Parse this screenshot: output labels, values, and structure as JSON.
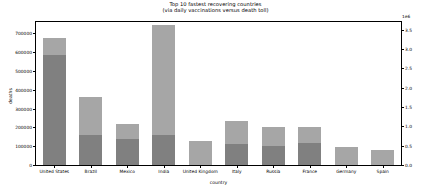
{
  "chart_data": {
    "type": "bar",
    "title": "Top 10 fastest recovering countries",
    "subtitle": "(via daily vaccinations versus death toll)",
    "title_lines": [
      "Top 10 fastest recovering countries",
      "(via daily vaccinations versus death toll)"
    ],
    "xlabel": "country",
    "ylabel": "deaths",
    "ylabel_right": "Total number of daily vaccinations (in millions)",
    "right_axis_exponent": "1e6",
    "grid": false,
    "legend": "none",
    "categories": [
      "United States",
      "Brazil",
      "Mexico",
      "India",
      "United Kingdom",
      "Italy",
      "Russia",
      "France",
      "Germany",
      "Spain"
    ],
    "ylim": [
      0,
      760000
    ],
    "yticks": [
      0,
      100000,
      200000,
      300000,
      400000,
      500000,
      600000,
      700000
    ],
    "ytick_labels": [
      "0",
      "100000",
      "200000",
      "300000",
      "400000",
      "500000",
      "600000",
      "700000"
    ],
    "ylim_right": [
      0.0,
      3.7
    ],
    "yticks_right": [
      0.0,
      0.5,
      1.0,
      1.5,
      2.0,
      2.5,
      3.0,
      3.5
    ],
    "ytick_labels_right": [
      "0.0",
      "0.5",
      "1.0",
      "1.5",
      "2.0",
      "2.5",
      "3.0",
      "3.5"
    ],
    "series": [
      {
        "name": "deaths",
        "axis": "left",
        "color": "#808080",
        "values": [
          572000,
          152000,
          136000,
          245000,
          0,
          108000,
          101000,
          118000,
          0,
          0
        ]
      },
      {
        "name": "daily vaccinations",
        "axis": "right",
        "color": "#a6a6a6",
        "values": [
          0.3,
          0.89,
          0.35,
          2.58,
          0.62,
          0.61,
          0.49,
          0.42,
          0.47,
          0.41
        ]
      }
    ],
    "bar_totals_left_units": [
      632000,
      352000,
      208000,
      732000,
      125000,
      230000,
      200000,
      200000,
      190000,
      165000
    ]
  },
  "bars": [
    {
      "label": "United States",
      "death_px": 110,
      "vacc_px": 17
    },
    {
      "label": "Brazil",
      "death_px": 30,
      "vacc_px": 38
    },
    {
      "label": "Mexico",
      "death_px": 26,
      "vacc_px": 15
    },
    {
      "label": "India",
      "death_px": 30,
      "vacc_px": 110
    },
    {
      "label": "United Kingdom",
      "death_px": 0,
      "vacc_px": 24
    },
    {
      "label": "Italy",
      "death_px": 21,
      "vacc_px": 23
    },
    {
      "label": "Russia",
      "death_px": 19,
      "vacc_px": 19
    },
    {
      "label": "France",
      "death_px": 22,
      "vacc_px": 16
    },
    {
      "label": "Germany",
      "death_px": 0,
      "vacc_px": 18
    },
    {
      "label": "Spain",
      "death_px": 0,
      "vacc_px": 15
    }
  ],
  "colors": {
    "bar_vaccinations": "#a6a6a6",
    "bar_deaths": "#808080",
    "axis": "#000000",
    "background": "#ffffff"
  }
}
